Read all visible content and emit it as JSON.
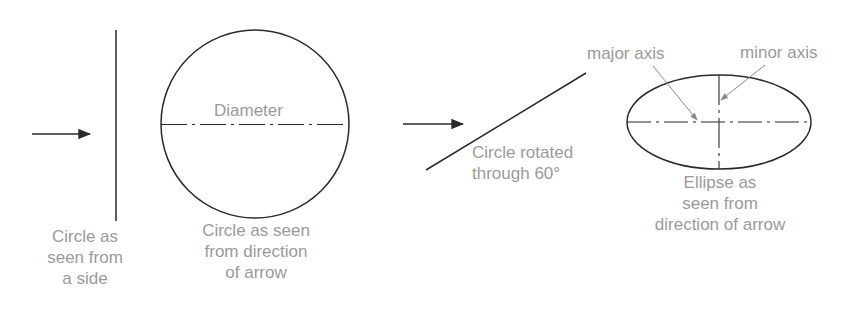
{
  "diagram": {
    "colors": {
      "line": "#2a2a2a",
      "label": "#9a9a9a",
      "leader": "#8a8a8a"
    },
    "panel1": {
      "caption": [
        "Circle as",
        "seen from",
        "a side"
      ]
    },
    "panel2": {
      "inner_label": "Diameter",
      "caption": [
        "Circle as seen",
        "from direction",
        "of arrow"
      ]
    },
    "panel3": {
      "caption": [
        "Circle rotated",
        "through 60°"
      ]
    },
    "panel4": {
      "major_label": "major axis",
      "minor_label": "minor axis",
      "caption": [
        "Ellipse as",
        "seen from",
        "direction of arrow"
      ]
    }
  }
}
